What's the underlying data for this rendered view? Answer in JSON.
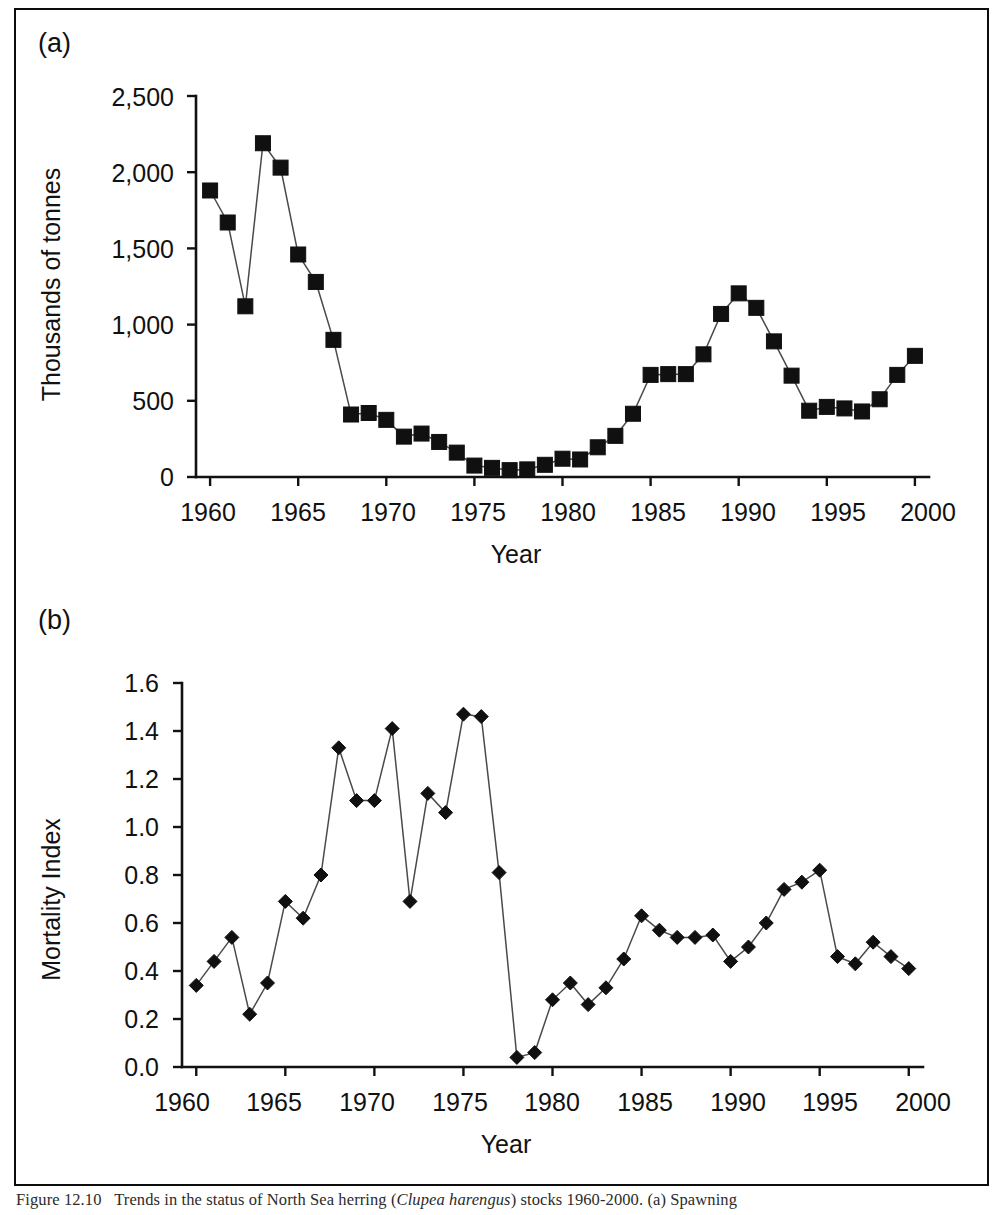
{
  "figure": {
    "caption_prefix": "Figure 12.10",
    "caption_text": "Trends in the status of North Sea herring (",
    "caption_species": "Clupea harengus",
    "caption_text2": ") stocks 1960-2000. (a) Spawning",
    "frame_color": "#0c0c0c",
    "background": "#ffffff"
  },
  "panel_a": {
    "label": "(a)",
    "chart_data": {
      "type": "line",
      "title": "",
      "xlabel": "Year",
      "ylabel": "Thousands of tonnes",
      "xlim": [
        1959.2,
        2000.8
      ],
      "ylim": [
        0,
        2500
      ],
      "ytick_labels": [
        "0",
        "500",
        "1,000",
        "1,500",
        "2,000",
        "2,500"
      ],
      "yticks": [
        0,
        500,
        1000,
        1500,
        2000,
        2500
      ],
      "xtick_labels": [
        "1960",
        "1965",
        "1970",
        "1975",
        "1980",
        "1985",
        "1990",
        "1995",
        "2000"
      ],
      "xticks": [
        1960,
        1965,
        1970,
        1975,
        1980,
        1985,
        1990,
        1995,
        2000
      ],
      "grid": false,
      "legend": "none",
      "marker": "square",
      "marker_color": "#101010",
      "line_color": "#4a4a4a",
      "x": [
        1960,
        1961,
        1962,
        1963,
        1964,
        1965,
        1966,
        1967,
        1968,
        1969,
        1970,
        1971,
        1972,
        1973,
        1974,
        1975,
        1976,
        1977,
        1978,
        1979,
        1980,
        1981,
        1982,
        1983,
        1984,
        1985,
        1986,
        1987,
        1988,
        1989,
        1990,
        1991,
        1992,
        1993,
        1994,
        1995,
        1996,
        1997,
        1998,
        1999,
        2000
      ],
      "values": [
        1880,
        1670,
        1120,
        2190,
        2030,
        1460,
        1280,
        900,
        410,
        420,
        375,
        265,
        285,
        230,
        160,
        75,
        60,
        45,
        50,
        80,
        120,
        115,
        195,
        270,
        415,
        670,
        675,
        675,
        805,
        1070,
        1205,
        1110,
        890,
        665,
        435,
        460,
        450,
        430,
        510,
        670,
        795,
        755
      ]
    }
  },
  "panel_b": {
    "label": "(b)",
    "chart_data": {
      "type": "line",
      "title": "",
      "xlabel": "Year",
      "ylabel": "Mortality Index",
      "xlim": [
        1959.2,
        2000.8
      ],
      "ylim": [
        0.0,
        1.6
      ],
      "ytick_labels": [
        "0.0",
        "0.2",
        "0.4",
        "0.6",
        "0.8",
        "1.0",
        "1.2",
        "1.4",
        "1.6"
      ],
      "yticks": [
        0.0,
        0.2,
        0.4,
        0.6,
        0.8,
        1.0,
        1.2,
        1.4,
        1.6
      ],
      "xtick_labels": [
        "1960",
        "1965",
        "1970",
        "1975",
        "1980",
        "1985",
        "1990",
        "1995",
        "2000"
      ],
      "xticks": [
        1960,
        1965,
        1970,
        1975,
        1980,
        1985,
        1990,
        1995,
        2000
      ],
      "grid": false,
      "legend": "none",
      "marker": "diamond",
      "marker_color": "#101010",
      "line_color": "#4a4a4a",
      "x": [
        1960,
        1961,
        1962,
        1963,
        1964,
        1965,
        1966,
        1967,
        1968,
        1969,
        1970,
        1971,
        1972,
        1973,
        1974,
        1975,
        1976,
        1977,
        1978,
        1979,
        1980,
        1981,
        1982,
        1983,
        1984,
        1985,
        1986,
        1987,
        1988,
        1989,
        1990,
        1991,
        1992,
        1993,
        1994,
        1995,
        1996,
        1997,
        1998,
        1999,
        2000
      ],
      "values": [
        0.34,
        0.44,
        0.54,
        0.22,
        0.35,
        0.69,
        0.62,
        0.8,
        1.33,
        1.11,
        1.11,
        1.41,
        0.69,
        1.14,
        1.06,
        1.47,
        1.46,
        0.81,
        0.04,
        0.06,
        0.28,
        0.35,
        0.26,
        0.33,
        0.45,
        0.63,
        0.57,
        0.54,
        0.54,
        0.55,
        0.44,
        0.5,
        0.6,
        0.74,
        0.77,
        0.82,
        0.46,
        0.43,
        0.52,
        0.46,
        0.41
      ]
    }
  }
}
